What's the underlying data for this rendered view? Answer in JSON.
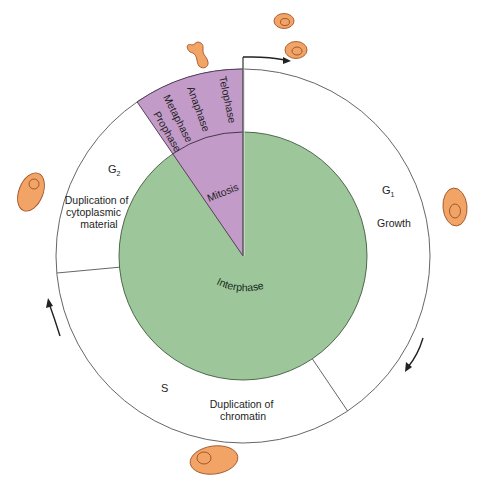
{
  "diagram": {
    "colors": {
      "interphase_fill": "#9dc79a",
      "mitosis_fill": "#c39bc9",
      "cell_fill": "#f2a466",
      "cell_stroke": "#a0552a",
      "line": "#444444",
      "arrow": "#222222"
    },
    "inner": {
      "interphase_label": "Interphase",
      "mitosis_label": "Mitosis"
    },
    "mitosis_phases": [
      "Prophase",
      "Metaphase",
      "Anaphase",
      "Telophase"
    ],
    "phases": {
      "g1": {
        "name": "G",
        "subscript": "1",
        "desc_lines": [
          "Growth"
        ]
      },
      "s": {
        "name": "S",
        "subscript": "",
        "desc_lines": [
          "Duplication of",
          "chromatin"
        ]
      },
      "g2": {
        "name": "G",
        "subscript": "2",
        "desc_lines": [
          "Duplication of",
          "cytoplasmic",
          "material"
        ]
      }
    },
    "cells": [
      {
        "name": "dividing-cell",
        "position": "top"
      },
      {
        "name": "daughter-cell-1",
        "position": "top-right"
      },
      {
        "name": "daughter-cell-2",
        "position": "top-right"
      },
      {
        "name": "g1-cell",
        "position": "right"
      },
      {
        "name": "s-cell",
        "position": "bottom"
      },
      {
        "name": "g2-cell",
        "position": "left"
      }
    ]
  }
}
